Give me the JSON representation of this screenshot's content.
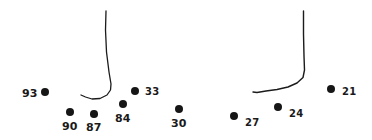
{
  "figure": {
    "background_color": "#ffffff",
    "ink_color": "#161616",
    "width": 372,
    "height": 140
  },
  "chart_data": {
    "type": "scatter",
    "subtitle": "",
    "xlabel": "",
    "ylabel": "",
    "xlim": [
      0,
      372
    ],
    "ylim": [
      0,
      140
    ],
    "grid": false,
    "legend": null,
    "axes_visible": false,
    "point_label_field": "label",
    "points": [
      {
        "label": "93",
        "x": 45,
        "y": 92,
        "r": 4.0,
        "label_x": 22,
        "label_y": 88,
        "label_side": "left"
      },
      {
        "label": "90",
        "x": 70,
        "y": 112,
        "r": 4.0,
        "label_x": 62,
        "label_y": 121,
        "label_side": "below"
      },
      {
        "label": "87",
        "x": 94,
        "y": 114,
        "r": 3.8,
        "label_x": 86,
        "label_y": 122,
        "label_side": "below"
      },
      {
        "label": "84",
        "x": 123,
        "y": 104,
        "r": 4.2,
        "label_x": 115,
        "label_y": 113,
        "label_side": "below"
      },
      {
        "label": "33",
        "x": 135,
        "y": 91,
        "r": 4.2,
        "label_x": 145,
        "label_y": 87,
        "label_side": "right"
      },
      {
        "label": "30",
        "x": 179,
        "y": 109,
        "r": 4.0,
        "label_x": 171,
        "label_y": 118,
        "label_side": "below"
      },
      {
        "label": "27",
        "x": 234,
        "y": 116,
        "r": 4.0,
        "label_x": 245,
        "label_y": 118,
        "label_side": "right"
      },
      {
        "label": "24",
        "x": 278,
        "y": 107,
        "r": 4.0,
        "label_x": 289,
        "label_y": 109,
        "label_side": "right"
      },
      {
        "label": "21",
        "x": 331,
        "y": 89,
        "r": 4.2,
        "label_x": 342,
        "label_y": 87,
        "label_side": "right"
      }
    ],
    "curves": [
      {
        "name": "left-outline-curve",
        "stroke_width": 1.3,
        "path": "M 106 11 L 105.5 30 L 106.5 52 L 109 72 L 111 84 L 110.5 90 L 107 95 L 100 98.5 L 92 99 L 85.5 97 L 81 95"
      },
      {
        "name": "right-outline-curve",
        "stroke_width": 1.4,
        "path": "M 303.5 11 L 303.5 34 L 304 56 L 304.5 70 L 303 77.5 L 297 83 L 288 87 L 277 89.5 L 266 91 L 257 92.5 L 253 92"
      }
    ]
  }
}
